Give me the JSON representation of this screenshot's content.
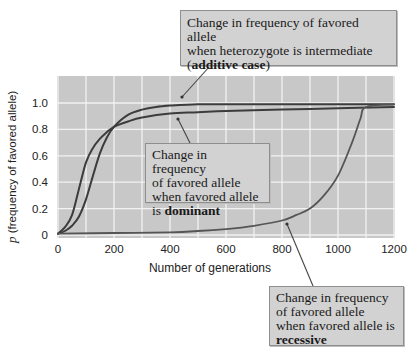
{
  "chart_data": {
    "type": "line",
    "title": "",
    "xlabel": "Number of generations",
    "ylabel_symbol": "p",
    "ylabel_rest": " (frequency of favored allele)",
    "ylabel": "p (frequency of favored allele)",
    "xlim": [
      0,
      1200
    ],
    "ylim": [
      0,
      1.15
    ],
    "xticks": [
      0,
      200,
      400,
      600,
      800,
      1000,
      1200
    ],
    "yticks": [
      0,
      0.2,
      0.4,
      0.6,
      0.8,
      1.0
    ],
    "xtick_labels": [
      "0",
      "200",
      "400",
      "600",
      "800",
      "1000",
      "1200"
    ],
    "ytick_labels": [
      "0",
      "0.2",
      "0.4",
      "0.6",
      "0.8",
      "1.0"
    ],
    "grid": true,
    "grid_step_x": 100,
    "grid_step_y": 0.2,
    "legend": "none (callout annotations)",
    "series": [
      {
        "name": "additive case (heterozygote intermediate)",
        "x": [
          0,
          25,
          50,
          75,
          100,
          125,
          150,
          175,
          200,
          250,
          300,
          350,
          400,
          500,
          600,
          800,
          1000,
          1200
        ],
        "y": [
          0.01,
          0.03,
          0.07,
          0.14,
          0.27,
          0.45,
          0.62,
          0.74,
          0.82,
          0.91,
          0.95,
          0.97,
          0.98,
          0.99,
          0.99,
          0.99,
          0.99,
          0.99
        ]
      },
      {
        "name": "favored allele dominant",
        "x": [
          0,
          25,
          50,
          75,
          100,
          125,
          150,
          175,
          200,
          250,
          300,
          400,
          500,
          600,
          800,
          1000,
          1200
        ],
        "y": [
          0.01,
          0.06,
          0.15,
          0.35,
          0.55,
          0.66,
          0.73,
          0.78,
          0.82,
          0.86,
          0.89,
          0.92,
          0.93,
          0.94,
          0.95,
          0.96,
          0.97
        ]
      },
      {
        "name": "favored allele recessive",
        "x": [
          0,
          200,
          400,
          500,
          600,
          700,
          800,
          850,
          900,
          950,
          1000,
          1050,
          1080,
          1100,
          1200
        ],
        "y": [
          0.01,
          0.015,
          0.02,
          0.03,
          0.045,
          0.07,
          0.11,
          0.15,
          0.2,
          0.3,
          0.45,
          0.7,
          0.88,
          0.97,
          0.99
        ]
      }
    ],
    "annotations": [
      {
        "target": "additive case",
        "text": "Change in frequency of favored allele when heterozygote is intermediate (additive case)"
      },
      {
        "target": "dominant",
        "text": "Change in frequency of favored allele when favored allele is dominant"
      },
      {
        "target": "recessive",
        "text": "Change in frequency of favored allele when favored allele is recessive"
      }
    ]
  },
  "callouts": {
    "additive": {
      "line1": "Change in frequency of favored allele",
      "line2": "when heterozygote is intermediate",
      "open_paren": "(",
      "bold": "additive case",
      "close_paren": ")"
    },
    "dominant": {
      "line1": "Change in frequency",
      "line2": "of favored allele",
      "line3": "when favored allele",
      "prefix": "is ",
      "bold": "dominant"
    },
    "recessive": {
      "line1": "Change in frequency",
      "line2": "of favored allele",
      "line3": "when favored allele is",
      "bold": "recessive"
    }
  },
  "colors": {
    "plot_background": "#c8c8c8",
    "gridline": "#f2f2f2",
    "curve": "#3c3c3c",
    "recessive_curve": "#555555",
    "callout_background": "#d2d2d2",
    "callout_border": "#8e8e8e",
    "text": "#222222"
  }
}
